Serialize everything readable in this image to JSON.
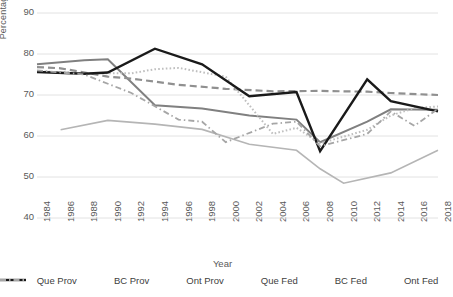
{
  "chart_data": {
    "type": "line",
    "title": "",
    "xlabel": "Year",
    "ylabel": "Percentage Turnout",
    "ylim": [
      40,
      90
    ],
    "ytick_values": [
      90,
      80,
      70,
      60,
      50,
      40
    ],
    "grid": "horizontal",
    "legend_position": "bottom",
    "x": [
      1984,
      1986,
      1988,
      1990,
      1992,
      1994,
      1996,
      1998,
      2000,
      2002,
      2004,
      2006,
      2008,
      2010,
      2012,
      2014,
      2016,
      2018
    ],
    "categories": [
      "1984",
      "1986",
      "1988",
      "1990",
      "1992",
      "1994",
      "1996",
      "1998",
      "2000",
      "2002",
      "2004",
      "2006",
      "2008",
      "2010",
      "2012",
      "2014",
      "2016",
      "2018"
    ],
    "series": [
      {
        "name": "Que Prov",
        "color": "#808080",
        "style": "solid",
        "width": 2,
        "points": [
          {
            "x": 1984,
            "y": 77.5
          },
          {
            "x": 1988,
            "y": 78.5
          },
          {
            "x": 1990,
            "y": 78.7
          },
          {
            "x": 1994,
            "y": 67.5
          },
          {
            "x": 1998,
            "y": 66.7
          },
          {
            "x": 2002,
            "y": 65.0
          },
          {
            "x": 2006,
            "y": 64.0
          },
          {
            "x": 2008,
            "y": 58.5
          },
          {
            "x": 2012,
            "y": 63.5
          },
          {
            "x": 2014,
            "y": 66.5
          },
          {
            "x": 2018,
            "y": 66.4
          }
        ]
      },
      {
        "name": "BC Prov",
        "color": "#909090",
        "style": "dashed",
        "width": 2.2,
        "points": [
          {
            "x": 1984,
            "y": 76.8
          },
          {
            "x": 1986,
            "y": 76.5
          },
          {
            "x": 1990,
            "y": 74.5
          },
          {
            "x": 1992,
            "y": 74.0
          },
          {
            "x": 1996,
            "y": 72.5
          },
          {
            "x": 2000,
            "y": 71.5
          },
          {
            "x": 2004,
            "y": 70.9
          },
          {
            "x": 2008,
            "y": 71.0
          },
          {
            "x": 2012,
            "y": 70.8
          },
          {
            "x": 2014,
            "y": 70.5
          },
          {
            "x": 2018,
            "y": 70.0
          }
        ]
      },
      {
        "name": "Ont Prov",
        "color": "#b5b5b5",
        "style": "solid",
        "width": 1.6,
        "points": [
          {
            "x": 1986,
            "y": 61.5
          },
          {
            "x": 1990,
            "y": 63.8
          },
          {
            "x": 1994,
            "y": 62.9
          },
          {
            "x": 1998,
            "y": 61.6
          },
          {
            "x": 2002,
            "y": 58.0
          },
          {
            "x": 2006,
            "y": 56.5
          },
          {
            "x": 2008,
            "y": 52.0
          },
          {
            "x": 2010,
            "y": 48.5
          },
          {
            "x": 2014,
            "y": 51.0
          },
          {
            "x": 2018,
            "y": 56.5
          }
        ]
      },
      {
        "name": "Que Fed",
        "color": "#bfbfbf",
        "style": "dotted",
        "width": 2,
        "points": [
          {
            "x": 1984,
            "y": 75.8
          },
          {
            "x": 1988,
            "y": 75.3
          },
          {
            "x": 1992,
            "y": 75.3
          },
          {
            "x": 1994,
            "y": 76.3
          },
          {
            "x": 1996,
            "y": 76.6
          },
          {
            "x": 2000,
            "y": 74.5
          },
          {
            "x": 2004,
            "y": 60.5
          },
          {
            "x": 2006,
            "y": 62.0
          },
          {
            "x": 2008,
            "y": 58.2
          },
          {
            "x": 2012,
            "y": 61.5
          },
          {
            "x": 2014,
            "y": 65.0
          },
          {
            "x": 2016,
            "y": 66.8
          },
          {
            "x": 2018,
            "y": 67.2
          }
        ]
      },
      {
        "name": "BC Fed",
        "color": "#1a1a1a",
        "style": "solid",
        "width": 2.4,
        "points": [
          {
            "x": 1984,
            "y": 75.6
          },
          {
            "x": 1988,
            "y": 75.2
          },
          {
            "x": 1990,
            "y": 75.5
          },
          {
            "x": 1994,
            "y": 81.3
          },
          {
            "x": 1998,
            "y": 77.5
          },
          {
            "x": 2002,
            "y": 69.7
          },
          {
            "x": 2006,
            "y": 70.7
          },
          {
            "x": 2008,
            "y": 56.3
          },
          {
            "x": 2012,
            "y": 73.8
          },
          {
            "x": 2014,
            "y": 68.5
          },
          {
            "x": 2018,
            "y": 66.0
          }
        ]
      },
      {
        "name": "Ont Fed",
        "color": "#a6a6a6",
        "style": "dashdot",
        "width": 1.8,
        "points": [
          {
            "x": 1984,
            "y": 76.0
          },
          {
            "x": 1988,
            "y": 75.0
          },
          {
            "x": 1992,
            "y": 70.5
          },
          {
            "x": 1996,
            "y": 64.0
          },
          {
            "x": 1998,
            "y": 63.5
          },
          {
            "x": 2000,
            "y": 58.5
          },
          {
            "x": 2004,
            "y": 63.0
          },
          {
            "x": 2006,
            "y": 63.5
          },
          {
            "x": 2008,
            "y": 57.5
          },
          {
            "x": 2012,
            "y": 60.5
          },
          {
            "x": 2014,
            "y": 66.0
          },
          {
            "x": 2016,
            "y": 62.5
          },
          {
            "x": 2018,
            "y": 66.6
          }
        ]
      }
    ]
  },
  "axes": {
    "ylabel": "Percentage Turnout",
    "xlabel": "Year",
    "yticks": [
      "90",
      "80",
      "70",
      "60",
      "50",
      "40"
    ],
    "xticks": [
      "1984",
      "1986",
      "1988",
      "1990",
      "1992",
      "1994",
      "1996",
      "1998",
      "2000",
      "2002",
      "2004",
      "2006",
      "2008",
      "2010",
      "2012",
      "2014",
      "2016",
      "2018"
    ]
  },
  "legend": {
    "items": [
      {
        "label": "Que Prov"
      },
      {
        "label": "BC Prov"
      },
      {
        "label": "Ont Prov"
      },
      {
        "label": "Que Fed"
      },
      {
        "label": "BC Fed"
      },
      {
        "label": "Ont Fed"
      }
    ]
  }
}
